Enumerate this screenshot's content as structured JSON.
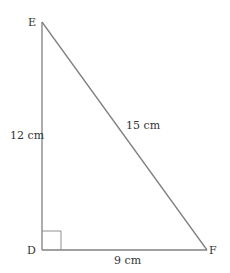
{
  "diagram": {
    "type": "right-triangle",
    "vertices": {
      "E": {
        "label": "E"
      },
      "D": {
        "label": "D"
      },
      "F": {
        "label": "F"
      }
    },
    "sides": {
      "ED": {
        "label": "12 cm"
      },
      "EF": {
        "label": "15 cm"
      },
      "DF": {
        "label": "9 cm"
      }
    },
    "right_angle_at": "D",
    "colors": {
      "line": "#808080",
      "text": "#333333"
    }
  }
}
